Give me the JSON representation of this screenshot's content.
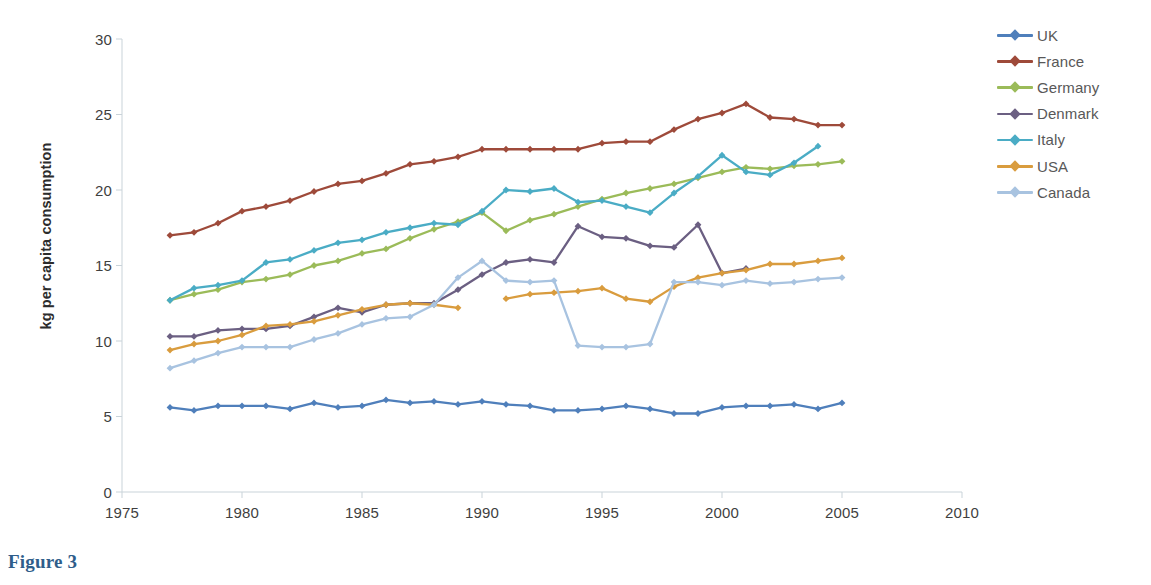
{
  "caption": "Figure 3",
  "chart_data": {
    "type": "line",
    "title": "",
    "xlabel": "",
    "ylabel": "kg per capita consumption",
    "xlim": [
      1975,
      2010
    ],
    "ylim": [
      0,
      30
    ],
    "xticks": [
      1975,
      1980,
      1985,
      1990,
      1995,
      2000,
      2005,
      2010
    ],
    "yticks": [
      0,
      5,
      10,
      15,
      20,
      25,
      30
    ],
    "grid": false,
    "legend_position": "right",
    "markers": "diamond",
    "series": [
      {
        "name": "UK",
        "color": "#4f7fbb",
        "x": [
          1977,
          1978,
          1979,
          1980,
          1981,
          1982,
          1983,
          1984,
          1985,
          1986,
          1987,
          1988,
          1989,
          1990,
          1991,
          1992,
          1993,
          1994,
          1995,
          1996,
          1997,
          1998,
          1999,
          2000,
          2001,
          2002,
          2003,
          2004,
          2005
        ],
        "values": [
          5.6,
          5.4,
          5.7,
          5.7,
          5.7,
          5.5,
          5.9,
          5.6,
          5.7,
          6.1,
          5.9,
          6.0,
          5.8,
          6.0,
          5.8,
          5.7,
          5.4,
          5.4,
          5.5,
          5.7,
          5.5,
          5.2,
          5.2,
          5.6,
          5.7,
          5.7,
          5.8,
          5.5,
          5.9
        ]
      },
      {
        "name": "France",
        "color": "#9e4a3a",
        "x": [
          1977,
          1978,
          1979,
          1980,
          1981,
          1982,
          1983,
          1984,
          1985,
          1986,
          1987,
          1988,
          1989,
          1990,
          1991,
          1992,
          1993,
          1994,
          1995,
          1996,
          1997,
          1998,
          1999,
          2000,
          2001,
          2002,
          2003,
          2004,
          2005
        ],
        "values": [
          17.0,
          17.2,
          17.8,
          18.6,
          18.9,
          19.3,
          19.9,
          20.4,
          20.6,
          21.1,
          21.7,
          21.9,
          22.2,
          22.7,
          22.7,
          22.7,
          22.7,
          22.7,
          23.1,
          23.2,
          23.2,
          24.0,
          24.7,
          25.1,
          25.7,
          24.8,
          24.7,
          24.3,
          24.3
        ]
      },
      {
        "name": "Germany",
        "color": "#9bbb59",
        "x": [
          1977,
          1978,
          1979,
          1980,
          1981,
          1982,
          1983,
          1984,
          1985,
          1986,
          1987,
          1988,
          1989,
          1990,
          1991,
          1992,
          1993,
          1994,
          1995,
          1996,
          1997,
          1998,
          1999,
          2000,
          2001,
          2002,
          2003,
          2004,
          2005
        ],
        "values": [
          12.7,
          13.1,
          13.4,
          13.9,
          14.1,
          14.4,
          15.0,
          15.3,
          15.8,
          16.1,
          16.8,
          17.4,
          17.9,
          18.5,
          17.3,
          18.0,
          18.4,
          18.9,
          19.4,
          19.8,
          20.1,
          20.4,
          20.8,
          21.2,
          21.5,
          21.4,
          21.6,
          21.7,
          21.9
        ]
      },
      {
        "name": "Denmark",
        "color": "#6b5f82",
        "x": [
          1977,
          1978,
          1979,
          1980,
          1981,
          1982,
          1983,
          1984,
          1985,
          1986,
          1987,
          1988,
          1989,
          1990,
          1991,
          1992,
          1993,
          1994,
          1995,
          1996,
          1997,
          1998,
          1999,
          2000,
          2001
        ],
        "values": [
          10.3,
          10.3,
          10.7,
          10.8,
          10.8,
          11.0,
          11.6,
          12.2,
          11.9,
          12.4,
          12.5,
          12.5,
          13.4,
          14.4,
          15.2,
          15.4,
          15.2,
          17.6,
          16.9,
          16.8,
          16.3,
          16.2,
          17.7,
          14.5,
          14.8
        ]
      },
      {
        "name": "Italy",
        "color": "#4aacc5",
        "x": [
          1977,
          1978,
          1979,
          1980,
          1981,
          1982,
          1983,
          1984,
          1985,
          1986,
          1987,
          1988,
          1989,
          1990,
          1991,
          1992,
          1993,
          1994,
          1995,
          1996,
          1997,
          1998,
          1999,
          2000,
          2001,
          2002,
          2003,
          2004
        ],
        "values": [
          12.7,
          13.5,
          13.7,
          14.0,
          15.2,
          15.4,
          16.0,
          16.5,
          16.7,
          17.2,
          17.5,
          17.8,
          17.7,
          18.6,
          20.0,
          19.9,
          20.1,
          19.2,
          19.3,
          18.9,
          18.5,
          19.8,
          20.9,
          22.3,
          21.2,
          21.0,
          21.8,
          22.9
        ]
      },
      {
        "name": "USA",
        "color": "#d99c3e",
        "x": [
          1977,
          1978,
          1979,
          1980,
          1981,
          1982,
          1983,
          1984,
          1985,
          1986,
          1987,
          1988,
          1989,
          1991,
          1992,
          1993,
          1994,
          1995,
          1996,
          1997,
          1998,
          1999,
          2000,
          2001,
          2002,
          2003,
          2004,
          2005
        ],
        "values": [
          9.4,
          9.8,
          10.0,
          10.4,
          11.0,
          11.1,
          11.3,
          11.7,
          12.1,
          12.4,
          12.5,
          12.4,
          12.2,
          12.8,
          13.1,
          13.2,
          13.3,
          13.5,
          12.8,
          12.6,
          13.6,
          14.2,
          14.5,
          14.7,
          15.1,
          15.1,
          15.3,
          15.5
        ]
      },
      {
        "name": "Canada",
        "color": "#a8c3e0",
        "x": [
          1977,
          1978,
          1979,
          1980,
          1981,
          1982,
          1983,
          1984,
          1985,
          1986,
          1987,
          1988,
          1989,
          1990,
          1991,
          1992,
          1993,
          1994,
          1995,
          1996,
          1997,
          1998,
          1999,
          2000,
          2001,
          2002,
          2003,
          2004,
          2005
        ],
        "values": [
          8.2,
          8.7,
          9.2,
          9.6,
          9.6,
          9.6,
          10.1,
          10.5,
          11.1,
          11.5,
          11.6,
          12.4,
          14.2,
          15.3,
          14.0,
          13.9,
          14.0,
          9.7,
          9.6,
          9.6,
          9.8,
          13.9,
          13.9,
          13.7,
          14.0,
          13.8,
          13.9,
          14.1,
          14.2
        ]
      }
    ]
  }
}
